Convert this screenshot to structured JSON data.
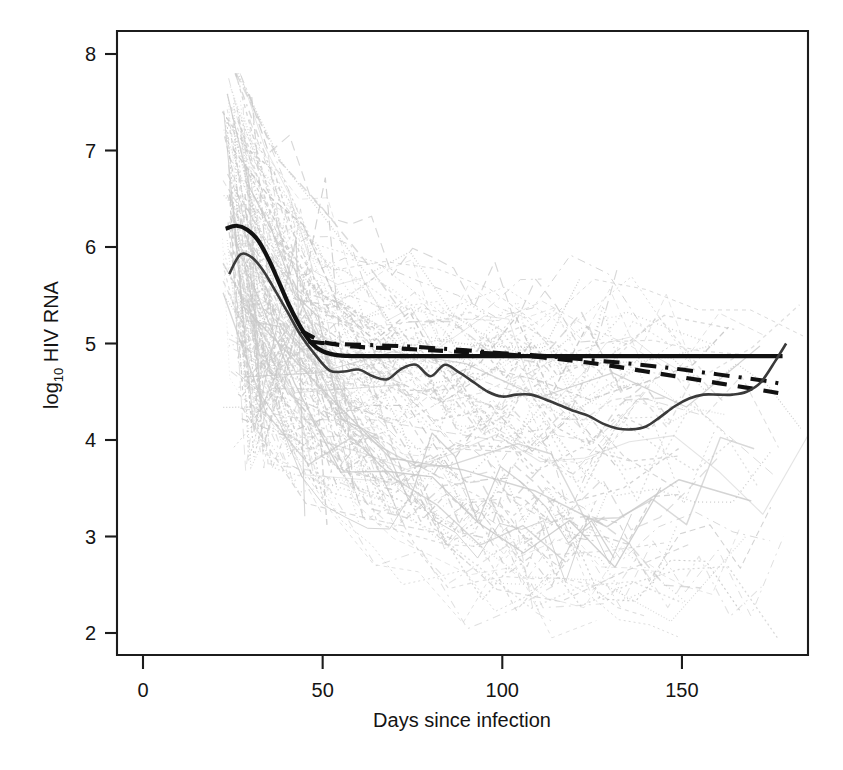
{
  "figure": {
    "background_color": "#ffffff",
    "axis_color": "#1c1c1c",
    "spaghetti_color": "#c9c9c9",
    "bold_curve_color": "#111111",
    "solid_curve_color": "#3a3a3a"
  },
  "chart_data": {
    "type": "line",
    "title": "",
    "xlabel": "Days since infection",
    "ylabel": "log10 HIV RNA",
    "ylabel_base": "log",
    "ylabel_sub": "10",
    "ylabel_rest": " HIV RNA",
    "xlim": [
      -5,
      193
    ],
    "ylim": [
      1.75,
      8.25
    ],
    "xticks": [
      0,
      50,
      100,
      150
    ],
    "xtick_labels": [
      "0",
      "50",
      "100",
      "150"
    ],
    "yticks": [
      2,
      3,
      4,
      5,
      6,
      7,
      8
    ],
    "ytick_labels": [
      "2",
      "3",
      "4",
      "5",
      "6",
      "7",
      "8"
    ],
    "grid": false,
    "legend": "none",
    "series": [
      {
        "name": "population-mean-smooth",
        "style": "solid-bold",
        "color": "#111111",
        "x": [
          23,
          26,
          29,
          32,
          35,
          38,
          41,
          44,
          47,
          50,
          54,
          58,
          62,
          66,
          70,
          75,
          80,
          85,
          90,
          95,
          100,
          110,
          120,
          130,
          140,
          150,
          160,
          170,
          178
        ],
        "y": [
          6.19,
          6.22,
          6.18,
          6.07,
          5.87,
          5.62,
          5.37,
          5.16,
          5.0,
          4.92,
          4.88,
          4.87,
          4.87,
          4.87,
          4.87,
          4.87,
          4.87,
          4.87,
          4.87,
          4.87,
          4.87,
          4.87,
          4.87,
          4.87,
          4.87,
          4.87,
          4.87,
          4.87,
          4.87
        ]
      },
      {
        "name": "model-fit-dashed",
        "style": "dashed-bold",
        "color": "#111111",
        "x": [
          44,
          50,
          56,
          62,
          70,
          80,
          90,
          100,
          110,
          120,
          130,
          140,
          150,
          160,
          170,
          178
        ],
        "y": [
          5.13,
          5.02,
          4.98,
          4.96,
          4.95,
          4.93,
          4.91,
          4.89,
          4.86,
          4.82,
          4.77,
          4.71,
          4.65,
          4.59,
          4.53,
          4.48
        ]
      },
      {
        "name": "model-fit-dashdot",
        "style": "dashdot-bold",
        "color": "#111111",
        "x": [
          46,
          52,
          58,
          66,
          74,
          82,
          90,
          100,
          112,
          124,
          136,
          148,
          160,
          172,
          178
        ],
        "y": [
          5.02,
          5.0,
          4.99,
          4.98,
          4.97,
          4.95,
          4.93,
          4.9,
          4.87,
          4.83,
          4.79,
          4.74,
          4.68,
          4.62,
          4.58
        ]
      },
      {
        "name": "empirical-mean-wiggly",
        "style": "solid-medium",
        "color": "#3a3a3a",
        "x": [
          24,
          27,
          30,
          33,
          36,
          40,
          44,
          48,
          52,
          56,
          60,
          64,
          68,
          72,
          76,
          80,
          84,
          88,
          92,
          96,
          100,
          104,
          108,
          112,
          116,
          120,
          124,
          128,
          132,
          136,
          140,
          144,
          148,
          152,
          156,
          160,
          164,
          168,
          172,
          176,
          179
        ],
        "y": [
          5.72,
          5.92,
          5.9,
          5.78,
          5.6,
          5.34,
          5.08,
          4.88,
          4.72,
          4.71,
          4.73,
          4.66,
          4.63,
          4.74,
          4.78,
          4.66,
          4.78,
          4.7,
          4.6,
          4.5,
          4.45,
          4.47,
          4.47,
          4.42,
          4.36,
          4.3,
          4.25,
          4.17,
          4.12,
          4.11,
          4.14,
          4.24,
          4.35,
          4.43,
          4.47,
          4.47,
          4.47,
          4.5,
          4.6,
          4.82,
          5.0
        ]
      }
    ],
    "spaghetti": {
      "name": "individual-patient-trajectories",
      "description": "light gray individual subject HIV RNA trajectories",
      "n_subjects": 96,
      "color": "#c9c9c9",
      "x_start_range": [
        22,
        30
      ],
      "x_end_range": [
        110,
        185
      ],
      "y_start_range": [
        3.6,
        7.75
      ],
      "y_end_range": [
        2.0,
        5.6
      ]
    }
  },
  "axis_render": {
    "plot_left_px": 117,
    "plot_right_px": 808,
    "plot_top_px": 31,
    "plot_bottom_px": 655,
    "x0_px": 143,
    "x_per_day_px": 3.593,
    "y8_px": 54,
    "y_per_unit_px": 96.5
  }
}
